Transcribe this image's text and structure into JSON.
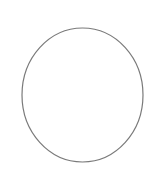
{
  "canvas": {
    "background": "#ffffff",
    "width": 150,
    "height": 180,
    "shape": {
      "type": "ellipse",
      "cx": 82.5,
      "cy": 95,
      "rx": 60.5,
      "ry": 67,
      "fill": "none",
      "stroke": "#7a7a7a",
      "stroke_width": 1.2
    }
  }
}
